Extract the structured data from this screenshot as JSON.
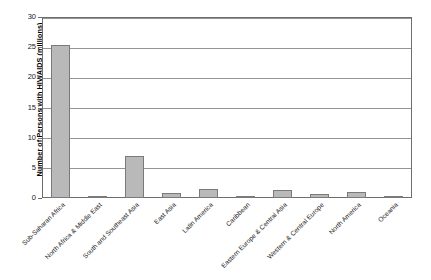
{
  "chart_data": {
    "type": "bar",
    "title": "",
    "subtitle": "",
    "xlabel": "",
    "ylabel": "Number of Persons with HIV/AIDS (millions)",
    "ylim": [
      0,
      30
    ],
    "ytick_labels": [
      "0",
      "5",
      "10",
      "15",
      "20",
      "25",
      "30"
    ],
    "ytick_values": [
      0,
      5,
      10,
      15,
      20,
      25,
      30
    ],
    "grid": true,
    "legend": false,
    "legend_position": "none",
    "bar_color": "#b9b9b9",
    "bar_border_color": "#7a7a7a",
    "axis_color": "#6e6e6e",
    "categories": [
      "Sub-Saharan Africa",
      "North Africa & Middle East",
      "South and Southeast Asia",
      "East Asia",
      "Latin America",
      "Caribbean",
      "Eastern Europe & Central Asia",
      "Western & Central Europe",
      "North America",
      "Oceania"
    ],
    "values": [
      25.3,
      0.4,
      7.0,
      0.9,
      1.5,
      0.4,
      1.3,
      0.6,
      1.0,
      0.15
    ]
  }
}
